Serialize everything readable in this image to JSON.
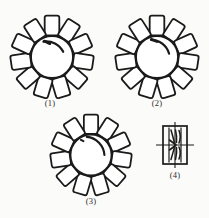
{
  "plate": {
    "title": "Rotary element line drawings",
    "background_color": "#fbfbfa",
    "ink_color": "#1a1a1a",
    "figure_count": 4
  },
  "figures": [
    {
      "id": "fig-1",
      "caption": "(1)",
      "kind": "toothed-rosette",
      "tooth_count": 11,
      "hub_shape": "circle",
      "has_inner_arc_mark": true,
      "tooth_shape": "rounded-rectangle",
      "rotation_deg": 0
    },
    {
      "id": "fig-2",
      "caption": "(2)",
      "kind": "toothed-rosette",
      "tooth_count": 11,
      "hub_shape": "circle",
      "has_inner_arc_mark": true,
      "tooth_shape": "rounded-rectangle",
      "rotation_deg": 0
    },
    {
      "id": "fig-3",
      "caption": "(3)",
      "kind": "toothed-rosette",
      "tooth_count": 11,
      "hub_shape": "circle",
      "has_inner_arc_mark": true,
      "tooth_shape": "rounded-rectangle",
      "rotation_deg": 0
    },
    {
      "id": "fig-4",
      "caption": "(4)",
      "kind": "crosshair-cell",
      "outline_shape": "vertical-rectangle",
      "has_crosshair_axes": true,
      "inner_motif": "paired-curved-strokes",
      "inner_panel_count": 2
    }
  ]
}
